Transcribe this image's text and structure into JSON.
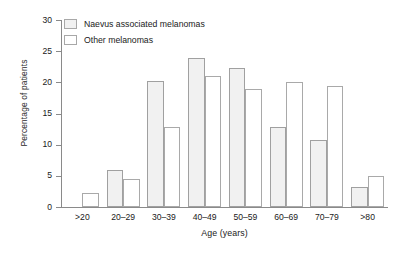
{
  "chart_data": {
    "type": "bar",
    "title": "",
    "xlabel": "Age (years)",
    "ylabel": "Percentage of patients",
    "categories": [
      ">20",
      "20–29",
      "30–39",
      "40–49",
      "50–59",
      "60–69",
      "70–79",
      ">80"
    ],
    "series": [
      {
        "name": "Naevus associated melanomas",
        "color": "#f1f1f1",
        "values": [
          0,
          6.0,
          20.2,
          23.9,
          22.3,
          12.9,
          10.7,
          3.2
        ]
      },
      {
        "name": "Other melanomas",
        "color": "#ffffff",
        "values": [
          2.3,
          4.5,
          12.9,
          21.0,
          19.0,
          20.0,
          19.4,
          5.0
        ]
      }
    ],
    "ylim": [
      0,
      30
    ],
    "yticks": [
      0,
      5,
      10,
      15,
      20,
      25,
      30
    ],
    "ytick_labels": [
      "0",
      "5",
      "10",
      "15",
      "20",
      "25",
      "30"
    ],
    "grid": false,
    "legend_position": "top-left"
  },
  "legend": {
    "items": [
      {
        "label": "Naevus associated melanomas"
      },
      {
        "label": "Other melanomas"
      }
    ]
  },
  "axes": {
    "y_title": "Percentage of patients",
    "x_title": "Age (years)"
  }
}
